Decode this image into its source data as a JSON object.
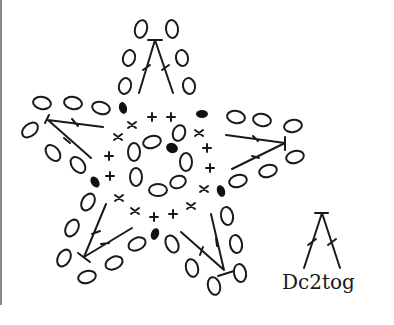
{
  "diagram": {
    "type": "crochet-chart",
    "stroke_color": "#1a1a1a",
    "background": "#ffffff",
    "frame_line_color": "#8a8a8a",
    "symbols": {
      "chain": "oval",
      "single_crochet": "cross (x/+)",
      "slip_stitch": "filled oval",
      "dc2tog": "two crossed-stem stitches joined at top"
    },
    "rounds": {
      "center_ring_chains": 8,
      "single_crochet_ring": 20,
      "slip_stitches": 6,
      "star_points": 5
    }
  },
  "legend": {
    "label": "Dc2tog",
    "symbol": "dc2tog-symbol"
  }
}
